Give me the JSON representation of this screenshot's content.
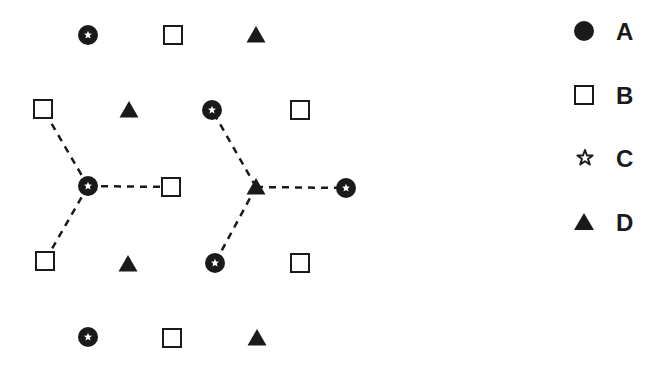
{
  "diagram": {
    "ink_color": "#1a1a1a",
    "background": "#ffffff",
    "nodes": [
      {
        "id": "r1c1",
        "type": "A",
        "x": 88,
        "y": 35
      },
      {
        "id": "r1c2",
        "type": "B",
        "x": 173,
        "y": 35
      },
      {
        "id": "r1c3",
        "type": "D",
        "x": 256,
        "y": 35
      },
      {
        "id": "r2c1",
        "type": "B",
        "x": 43,
        "y": 109
      },
      {
        "id": "r2c2",
        "type": "D",
        "x": 129,
        "y": 110
      },
      {
        "id": "r2c3",
        "type": "A",
        "x": 212,
        "y": 110
      },
      {
        "id": "r2c4",
        "type": "B",
        "x": 300,
        "y": 110
      },
      {
        "id": "r3c1",
        "type": "A",
        "x": 88,
        "y": 186
      },
      {
        "id": "r3c2",
        "type": "B",
        "x": 171,
        "y": 187
      },
      {
        "id": "r3c3",
        "type": "D",
        "x": 256,
        "y": 187
      },
      {
        "id": "r3c4",
        "type": "A",
        "x": 346,
        "y": 188
      },
      {
        "id": "r4c1",
        "type": "B",
        "x": 45,
        "y": 261
      },
      {
        "id": "r4c2",
        "type": "D",
        "x": 128,
        "y": 264
      },
      {
        "id": "r4c3",
        "type": "A",
        "x": 215,
        "y": 263
      },
      {
        "id": "r4c4",
        "type": "B",
        "x": 300,
        "y": 263
      },
      {
        "id": "r5c1",
        "type": "A",
        "x": 88,
        "y": 337
      },
      {
        "id": "r5c2",
        "type": "B",
        "x": 172,
        "y": 338
      },
      {
        "id": "r5c3",
        "type": "D",
        "x": 257,
        "y": 338
      }
    ],
    "bonds": [
      {
        "from": "r3c1",
        "to": "r2c1"
      },
      {
        "from": "r3c1",
        "to": "r3c2"
      },
      {
        "from": "r3c1",
        "to": "r4c1"
      },
      {
        "from": "r3c3",
        "to": "r2c3"
      },
      {
        "from": "r3c3",
        "to": "r3c4"
      },
      {
        "from": "r3c3",
        "to": "r4c3"
      }
    ]
  },
  "legend": {
    "items": [
      {
        "symbol": "filled-circle",
        "label": "A",
        "x": 584,
        "y": 31
      },
      {
        "symbol": "open-square",
        "label": "B",
        "x": 584,
        "y": 95
      },
      {
        "symbol": "star",
        "label": "C",
        "x": 585,
        "y": 158
      },
      {
        "symbol": "filled-triangle",
        "label": "D",
        "x": 584,
        "y": 222
      }
    ]
  }
}
